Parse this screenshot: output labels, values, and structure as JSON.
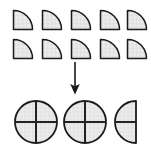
{
  "figure": {
    "title": "Quarter circle pieces combining into wholes",
    "caption": "",
    "background_color": "#ffffff",
    "fill_color": "#e9e9e9",
    "fill_color_light": "#f1f1f1",
    "stroke_color": "#1a1a1a",
    "inner_line_color": "#2b2b2b",
    "hatch_color": "#c9c9c9"
  },
  "source_group": {
    "name": "quarter-circle-pieces",
    "label": "",
    "total_count": 10,
    "piece_shape": "quarter-circle",
    "rows": [
      {
        "row_label": "",
        "count": 5,
        "pieces": [
          {
            "id": "q1",
            "shape": "quarter-circle",
            "value": "1/4"
          },
          {
            "id": "q2",
            "shape": "quarter-circle",
            "value": "1/4"
          },
          {
            "id": "q3",
            "shape": "quarter-circle",
            "value": "1/4"
          },
          {
            "id": "q4",
            "shape": "quarter-circle",
            "value": "1/4"
          },
          {
            "id": "q5",
            "shape": "quarter-circle",
            "value": "1/4"
          }
        ]
      },
      {
        "row_label": "",
        "count": 5,
        "pieces": [
          {
            "id": "q6",
            "shape": "quarter-circle",
            "value": "1/4"
          },
          {
            "id": "q7",
            "shape": "quarter-circle",
            "value": "1/4"
          },
          {
            "id": "q8",
            "shape": "quarter-circle",
            "value": "1/4"
          },
          {
            "id": "q9",
            "shape": "quarter-circle",
            "value": "1/4"
          },
          {
            "id": "q10",
            "shape": "quarter-circle",
            "value": "1/4"
          }
        ]
      }
    ]
  },
  "connector": {
    "name": "down-arrow",
    "direction": "down",
    "label": ""
  },
  "result_group": {
    "name": "assembled-result",
    "label": "",
    "items": [
      {
        "id": "r1",
        "shape": "full-circle",
        "value": "1",
        "divisions": 4,
        "description": "whole circle divided into quarters"
      },
      {
        "id": "r2",
        "shape": "full-circle",
        "value": "1",
        "divisions": 4,
        "description": "whole circle divided into quarters"
      },
      {
        "id": "r3",
        "shape": "half-circle-left",
        "value": "1/2",
        "divisions": 2,
        "description": "half circle divided into quarters"
      }
    ]
  }
}
